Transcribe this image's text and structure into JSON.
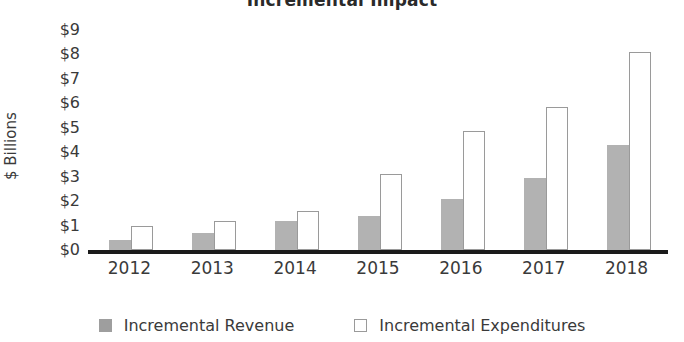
{
  "chart_data": {
    "type": "bar",
    "title": "Incremental Impact",
    "xlabel": "",
    "ylabel": "$ Billions",
    "categories": [
      "2012",
      "2013",
      "2014",
      "2015",
      "2016",
      "2017",
      "2018"
    ],
    "series": [
      {
        "name": "Incremental Revenue",
        "color": "#b2b2b2",
        "style": "filled",
        "values": [
          0.4,
          0.7,
          1.2,
          1.4,
          2.1,
          2.95,
          4.3
        ]
      },
      {
        "name": "Incremental Expenditures",
        "color": "#ffffff",
        "style": "hollow",
        "values": [
          1.0,
          1.2,
          1.6,
          3.1,
          4.85,
          5.85,
          8.1
        ]
      }
    ],
    "ylim": [
      0,
      9
    ],
    "y_ticks": [
      "$0",
      "$1",
      "$2",
      "$3",
      "$4",
      "$5",
      "$6",
      "$7",
      "$8",
      "$9"
    ],
    "y_tick_values": [
      0,
      1,
      2,
      3,
      4,
      5,
      6,
      7,
      8,
      9
    ],
    "grid": false,
    "legend_position": "bottom"
  },
  "axis": {
    "y_title": "$ Billions"
  },
  "legend": {
    "items": [
      {
        "label": "Incremental Revenue",
        "swatch": "filled-square-icon"
      },
      {
        "label": "Incremental Expenditures",
        "swatch": "hollow-square-icon"
      }
    ]
  }
}
